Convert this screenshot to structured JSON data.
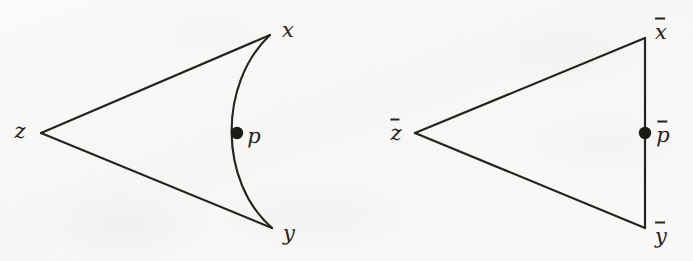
{
  "figure": {
    "caption": "",
    "background_color": "#faf9f8",
    "ink_color": "#25231f",
    "panels": [
      {
        "id": "left-panel",
        "name": "curved-geodesic-triangle",
        "shape_type": "triangle-with-curved-side",
        "apex_label": "z",
        "top_label": "x",
        "bottom_label": "y",
        "point_label": "p",
        "point_marker": "filled-dot",
        "vertices": {
          "z": [
            41,
            133
          ],
          "x": [
            270,
            35
          ],
          "y": [
            272,
            228
          ]
        },
        "curve": {
          "from": [
            270,
            35
          ],
          "to": [
            272,
            228
          ],
          "control_points": [
            [
              218,
              84
            ],
            [
              219,
              182
            ]
          ],
          "bulge_direction": "left"
        },
        "point_position": [
          237,
          133
        ],
        "label_positions": {
          "z": [
            20,
            131
          ],
          "x": [
            288,
            30
          ],
          "y": [
            289,
            233
          ],
          "p": [
            254,
            136
          ]
        }
      },
      {
        "id": "right-panel",
        "name": "straight-comparison-triangle",
        "shape_type": "triangle-straight-sides",
        "apex_label": "z̄",
        "top_label": "x̄",
        "bottom_label": "ȳ",
        "point_label": "p̄",
        "point_marker": "filled-dot",
        "vertices": {
          "zbar": [
            415,
            133
          ],
          "xbar": [
            645,
            38
          ],
          "ybar": [
            645,
            228
          ]
        },
        "point_position": [
          645,
          133
        ],
        "label_positions": {
          "zbar": [
            396,
            132
          ],
          "xbar": [
            661,
            31
          ],
          "ybar": [
            661,
            235
          ],
          "pbar": [
            663,
            134
          ]
        }
      }
    ],
    "labels": {
      "z": "z",
      "x": "x",
      "y": "y",
      "p": "p",
      "zbar": "z",
      "xbar": "x",
      "ybar": "y",
      "pbar": "p"
    },
    "stroke_width": 2,
    "dot_radius": 6
  }
}
